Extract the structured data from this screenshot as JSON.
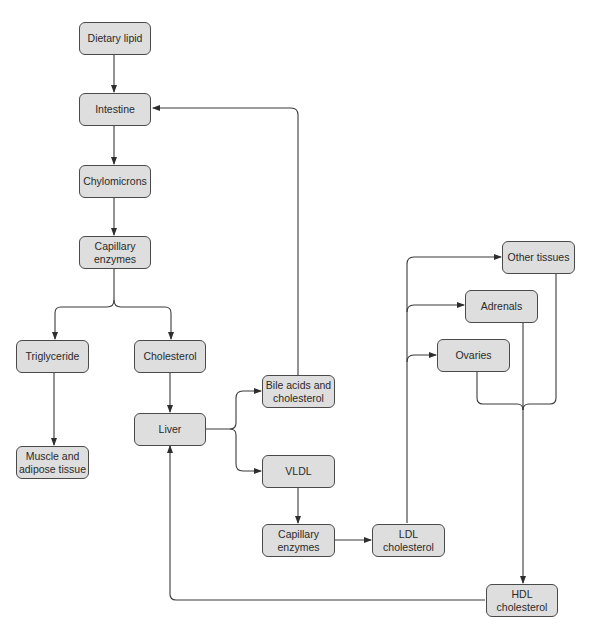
{
  "diagram": {
    "colors": {
      "node_fill": "#dedede",
      "node_border": "#4a4a4a",
      "edge": "#3a3a3a",
      "text": "#2a2a2a"
    },
    "nodes": {
      "dietary_lipid": "Dietary lipid",
      "intestine": "Intestine",
      "chylomicrons": "Chylomicrons",
      "capillary_enzymes_1": "Capillary\nenzymes",
      "triglyceride": "Triglyceride",
      "cholesterol": "Cholesterol",
      "muscle_adipose": "Muscle and\nadipose tissue",
      "liver": "Liver",
      "bile_acids": "Bile acids and\ncholesterol",
      "vldl": "VLDL",
      "capillary_enzymes_2": "Capillary\nenzymes",
      "ldl": "LDL\ncholesterol",
      "other_tissues": "Other tissues",
      "adrenals": "Adrenals",
      "ovaries": "Ovaries",
      "hdl": "HDL\ncholesterol"
    },
    "edges": [
      [
        "Dietary lipid",
        "Intestine"
      ],
      [
        "Intestine",
        "Chylomicrons"
      ],
      [
        "Chylomicrons",
        "Capillary enzymes"
      ],
      [
        "Capillary enzymes",
        "Triglyceride"
      ],
      [
        "Capillary enzymes",
        "Cholesterol"
      ],
      [
        "Triglyceride",
        "Muscle and adipose tissue"
      ],
      [
        "Cholesterol",
        "Liver"
      ],
      [
        "Liver",
        "Bile acids and cholesterol"
      ],
      [
        "Liver",
        "VLDL"
      ],
      [
        "Bile acids and cholesterol",
        "Intestine"
      ],
      [
        "VLDL",
        "Capillary enzymes"
      ],
      [
        "Capillary enzymes",
        "LDL cholesterol"
      ],
      [
        "LDL cholesterol",
        "Other tissues"
      ],
      [
        "LDL cholesterol",
        "Adrenals"
      ],
      [
        "LDL cholesterol",
        "Ovaries"
      ],
      [
        "Other tissues",
        "HDL cholesterol"
      ],
      [
        "Adrenals",
        "HDL cholesterol"
      ],
      [
        "Ovaries",
        "HDL cholesterol"
      ],
      [
        "HDL cholesterol",
        "Liver"
      ]
    ]
  }
}
